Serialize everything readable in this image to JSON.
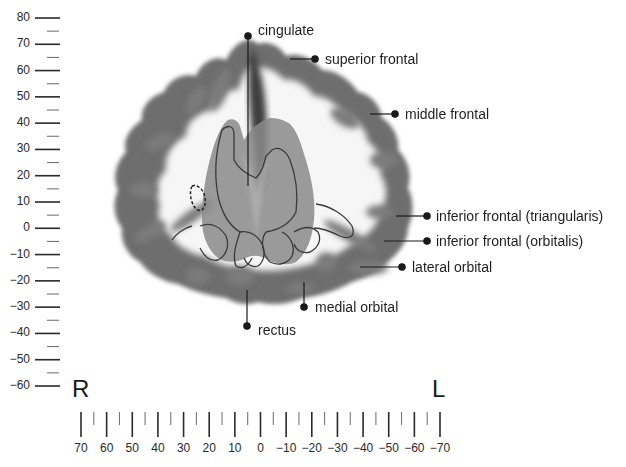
{
  "figure": {
    "type": "axial-brain-slice-annotation",
    "side_left": "R",
    "side_right": "L",
    "y_axis": {
      "ticks": [
        80,
        70,
        60,
        50,
        40,
        30,
        20,
        10,
        0,
        -10,
        -20,
        -30,
        -40,
        -50,
        -60
      ],
      "tick_labels": [
        "80",
        "70",
        "60",
        "50",
        "40",
        "30",
        "20",
        "10",
        "0",
        "−10",
        "−20",
        "−30",
        "−40",
        "−50",
        "−60"
      ]
    },
    "x_axis": {
      "ticks": [
        70,
        60,
        50,
        40,
        30,
        20,
        10,
        0,
        -10,
        -20,
        -30,
        -40,
        -50,
        -60,
        -70
      ],
      "tick_labels": [
        "70",
        "60",
        "50",
        "40",
        "30",
        "20",
        "10",
        "0",
        "−10",
        "−20",
        "−30",
        "−40",
        "−50",
        "−60",
        "−70"
      ]
    },
    "labels": [
      {
        "id": "cingulate",
        "text": "cingulate"
      },
      {
        "id": "superior-frontal",
        "text": "superior frontal"
      },
      {
        "id": "middle-frontal",
        "text": "middle frontal"
      },
      {
        "id": "inferior-frontal-triangularis",
        "text": "inferior frontal (triangularis)"
      },
      {
        "id": "inferior-frontal-orbitalis",
        "text": "inferior frontal (orbitalis)"
      },
      {
        "id": "lateral-orbital",
        "text": "lateral orbital"
      },
      {
        "id": "medial-orbital",
        "text": "medial orbital"
      },
      {
        "id": "rectus",
        "text": "rectus"
      }
    ],
    "colors": {
      "cortex_dark": "#4a4a4a",
      "cortex_mid": "#8a8a8a",
      "white_matter": "#f4f4f4",
      "overlay_gray": "#8c8c8c",
      "outline": "#3a3a3a",
      "leader": "#1a1a1a"
    }
  }
}
